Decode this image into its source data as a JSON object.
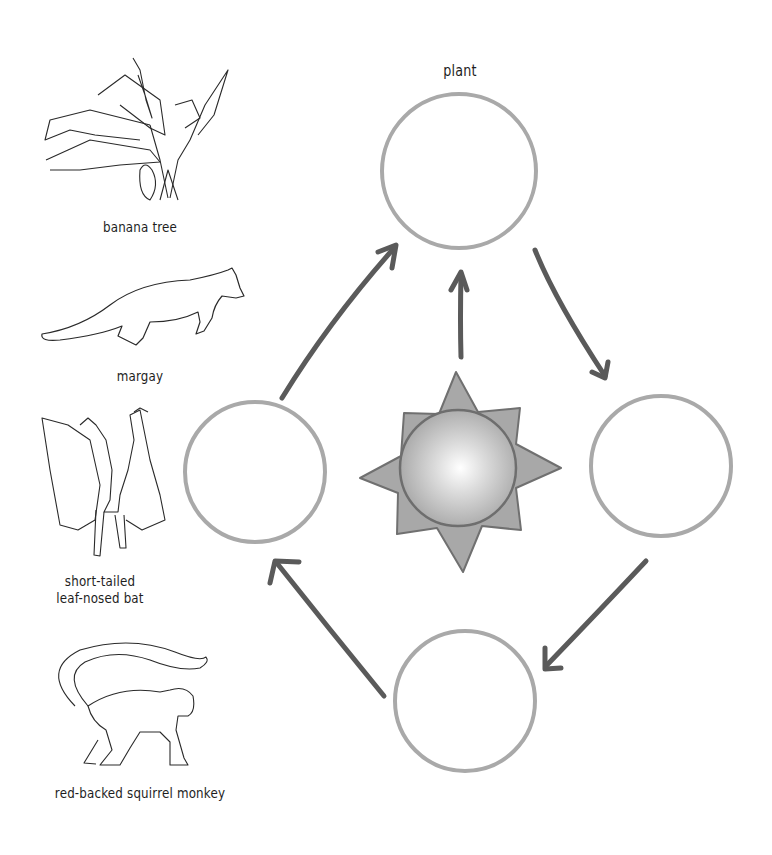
{
  "diagram": {
    "type": "food-web cycle",
    "center": {
      "name": "sun-icon"
    },
    "nodes": [
      {
        "id": "top",
        "label": "plant"
      },
      {
        "id": "right",
        "label": ""
      },
      {
        "id": "bottom",
        "label": ""
      },
      {
        "id": "left",
        "label": ""
      }
    ],
    "edges": [
      {
        "from": "sun",
        "to": "top"
      },
      {
        "from": "top",
        "to": "right"
      },
      {
        "from": "right",
        "to": "bottom"
      },
      {
        "from": "bottom",
        "to": "left"
      },
      {
        "from": "left",
        "to": "top"
      }
    ]
  },
  "organisms": [
    {
      "label": "banana tree"
    },
    {
      "label": "margay"
    },
    {
      "label": "short-tailed\nleaf-nosed bat",
      "line1": "short-tailed",
      "line2": "leaf-nosed bat"
    },
    {
      "label": "red-backed squirrel monkey"
    }
  ],
  "colors": {
    "circle_stroke": "#a9a9a9",
    "arrow": "#5a5a5a",
    "sun_star": "#a6a6a6",
    "sun_outline": "#6e6e6e",
    "line_art": "#2a2a2a"
  }
}
